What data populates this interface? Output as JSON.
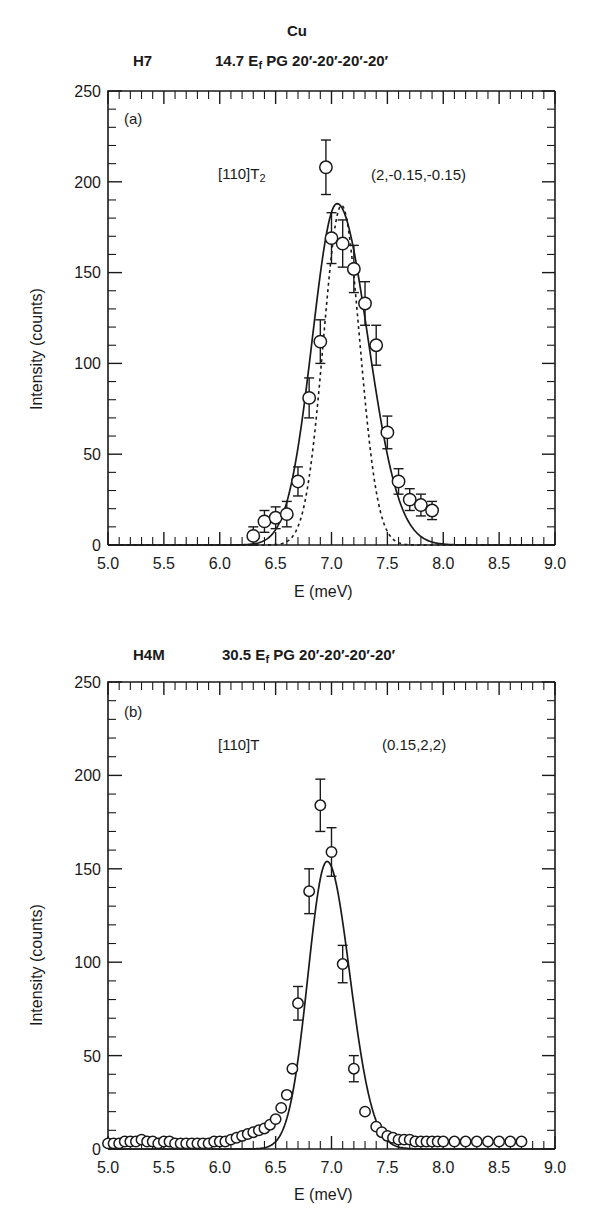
{
  "figure": {
    "title": "Cu",
    "xlabel": "E (meV)",
    "ylabel": "Intensity (counts)"
  },
  "panels": [
    {
      "id": "a",
      "tag": "(a)",
      "spectrometer": "H7",
      "config_pre": "14.7 E",
      "config_sub": "f",
      "config_post": " PG 20′-20′-20′-20′",
      "branch_pre": "[110]T",
      "branch_sub": "2",
      "qpoint": "(2,-0.15,-0.15)",
      "xlabel": "E (meV)",
      "ylabel": "Intensity (counts)",
      "xticklabels": [
        "5.0",
        "5.5",
        "6.0",
        "6.5",
        "7.0",
        "7.5",
        "8.0",
        "8.5",
        "9.0"
      ],
      "yticklabels": [
        "0",
        "50",
        "100",
        "150",
        "200",
        "250"
      ]
    },
    {
      "id": "b",
      "tag": "(b)",
      "spectrometer": "H4M",
      "config_pre": "30.5 E",
      "config_sub": "f",
      "config_post": " PG 20′-20′-20′-20′",
      "branch_pre": "[110]T",
      "branch_sub": "",
      "qpoint": "(0.15,2,2)",
      "xlabel": "E (meV)",
      "ylabel": "Intensity (counts)",
      "xticklabels": [
        "5.0",
        "5.5",
        "6.0",
        "6.5",
        "7.0",
        "7.5",
        "8.0",
        "8.5",
        "9.0"
      ],
      "yticklabels": [
        "0",
        "50",
        "100",
        "150",
        "200",
        "250"
      ]
    }
  ],
  "chart_data": [
    {
      "type": "scatter",
      "panel": "a",
      "title": "Cu",
      "subtitle": "H7   14.7 Ef PG 20'-20'-20'-20'",
      "annotations": [
        "(a)",
        "[110]T2",
        "(2,-0.15,-0.15)"
      ],
      "xlabel": "E (meV)",
      "ylabel": "Intensity (counts)",
      "xlim": [
        5.0,
        9.0
      ],
      "ylim": [
        0,
        250
      ],
      "xticks": [
        5.0,
        5.5,
        6.0,
        6.5,
        7.0,
        7.5,
        8.0,
        8.5,
        9.0
      ],
      "yticks": [
        0,
        50,
        100,
        150,
        200,
        250
      ],
      "minor_xtick_step": 0.1,
      "minor_ytick_step": 10,
      "grid": false,
      "legend": null,
      "marker": "open-circle",
      "errorbars": true,
      "x": [
        6.3,
        6.4,
        6.5,
        6.6,
        6.7,
        6.8,
        6.9,
        6.95,
        7.0,
        7.1,
        7.2,
        7.3,
        7.4,
        7.5,
        7.6,
        7.7,
        7.8,
        7.9
      ],
      "y": [
        5,
        13,
        15,
        17,
        35,
        81,
        112,
        208,
        169,
        166,
        152,
        133,
        110,
        62,
        35,
        25,
        22,
        19
      ],
      "yerr": [
        5,
        6,
        6,
        7,
        8,
        11,
        12,
        15,
        14,
        13,
        13,
        12,
        11,
        9,
        7,
        6,
        6,
        5
      ],
      "series": [
        {
          "name": "data",
          "values": [
            5,
            13,
            15,
            17,
            35,
            81,
            112,
            208,
            169,
            166,
            152,
            133,
            110,
            62,
            35,
            25,
            22,
            19
          ]
        },
        {
          "name": "solid fit (convolved)",
          "kind": "line",
          "style": "solid",
          "peak_x": 7.05,
          "peak_y": 188,
          "fwhm": 0.52
        },
        {
          "name": "dashed fit (resolution)",
          "kind": "line",
          "style": "dashed",
          "peak_x": 7.09,
          "peak_y": 187,
          "fwhm": 0.38
        }
      ]
    },
    {
      "type": "scatter",
      "panel": "b",
      "subtitle": "H4M   30.5 Ef PG 20'-20'-20'-20'",
      "annotations": [
        "(b)",
        "[110]T",
        "(0.15,2,2)"
      ],
      "xlabel": "E (meV)",
      "ylabel": "Intensity (counts)",
      "xlim": [
        5.0,
        9.0
      ],
      "ylim": [
        0,
        250
      ],
      "xticks": [
        5.0,
        5.5,
        6.0,
        6.5,
        7.0,
        7.5,
        8.0,
        8.5,
        9.0
      ],
      "yticks": [
        0,
        50,
        100,
        150,
        200,
        250
      ],
      "minor_xtick_step": 0.1,
      "minor_ytick_step": 10,
      "grid": false,
      "legend": null,
      "marker": "open-circle",
      "errorbars": true,
      "x": [
        5.0,
        5.05,
        5.1,
        5.15,
        5.2,
        5.25,
        5.3,
        5.35,
        5.4,
        5.45,
        5.5,
        5.55,
        5.6,
        5.65,
        5.7,
        5.75,
        5.8,
        5.85,
        5.9,
        5.95,
        6.0,
        6.05,
        6.1,
        6.15,
        6.2,
        6.25,
        6.3,
        6.35,
        6.4,
        6.45,
        6.5,
        6.55,
        6.6,
        6.65,
        6.7,
        6.8,
        6.9,
        7.0,
        7.1,
        7.2,
        7.3,
        7.4,
        7.45,
        7.5,
        7.55,
        7.6,
        7.65,
        7.7,
        7.75,
        7.8,
        7.85,
        7.9,
        7.95,
        8.0,
        8.1,
        8.2,
        8.3,
        8.4,
        8.5,
        8.6,
        8.7
      ],
      "y": [
        3,
        3,
        3,
        4,
        4,
        4,
        5,
        4,
        4,
        3,
        4,
        4,
        3,
        3,
        3,
        3,
        3,
        3,
        3,
        4,
        4,
        4,
        5,
        6,
        7,
        8,
        9,
        10,
        11,
        13,
        16,
        22,
        29,
        43,
        78,
        138,
        184,
        159,
        99,
        43,
        20,
        12,
        9,
        7,
        6,
        5,
        5,
        5,
        4,
        4,
        4,
        4,
        4,
        4,
        4,
        4,
        4,
        4,
        4,
        4,
        4
      ],
      "yerr_indices": [
        34,
        35,
        36,
        37,
        38,
        39
      ],
      "yerr_values": [
        9,
        12,
        14,
        13,
        10,
        7
      ],
      "series": [
        {
          "name": "data",
          "values": [
            3,
            3,
            3,
            4,
            4,
            4,
            5,
            4,
            4,
            3,
            4,
            4,
            3,
            3,
            3,
            3,
            3,
            3,
            3,
            4,
            4,
            4,
            5,
            6,
            7,
            8,
            9,
            10,
            11,
            13,
            16,
            22,
            29,
            43,
            78,
            138,
            184,
            159,
            99,
            43,
            20,
            12,
            9,
            7,
            6,
            5,
            5,
            5,
            4,
            4,
            4,
            4,
            4,
            4,
            4,
            4,
            4,
            4,
            4,
            4,
            4
          ]
        },
        {
          "name": "solid fit",
          "kind": "line",
          "style": "solid",
          "peak_x": 6.96,
          "peak_y": 154,
          "fwhm": 0.4
        }
      ]
    }
  ]
}
